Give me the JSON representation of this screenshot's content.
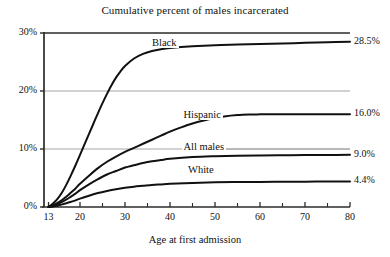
{
  "chart_data": {
    "type": "line",
    "title": "Cumulative percent of males incarcerated",
    "xlabel": "Age at first admission",
    "ylabel": "",
    "xlim": [
      13,
      80
    ],
    "ylim": [
      0,
      30
    ],
    "grid": true,
    "legend_position": "inline-labels",
    "x_ticks": [
      13,
      20,
      30,
      40,
      50,
      60,
      70,
      80
    ],
    "x_tick_labels": [
      "13",
      "20",
      "30",
      "40",
      "50",
      "60",
      "70",
      "80"
    ],
    "x_minor_ticks": [
      15,
      25,
      35,
      45,
      55,
      65,
      75
    ],
    "y_ticks": [
      0,
      10,
      20,
      30
    ],
    "y_tick_labels": [
      "0%",
      "10%",
      "20%",
      "30%"
    ],
    "series": [
      {
        "name": "Black",
        "label": "Black",
        "end_value_label": "28.5%",
        "end_value": 28.5,
        "x": [
          13,
          14,
          15,
          16,
          17,
          18,
          19,
          20,
          21,
          22,
          23,
          24,
          25,
          26,
          27,
          28,
          29,
          30,
          32,
          34,
          36,
          38,
          40,
          45,
          50,
          55,
          60,
          65,
          70,
          75,
          80
        ],
        "values": [
          0,
          0.6,
          1.4,
          2.5,
          3.9,
          5.5,
          7.2,
          9.0,
          10.8,
          12.6,
          14.4,
          16.2,
          17.9,
          19.5,
          21.0,
          22.3,
          23.4,
          24.3,
          25.6,
          26.4,
          26.9,
          27.2,
          27.4,
          27.7,
          27.9,
          28.0,
          28.1,
          28.2,
          28.3,
          28.4,
          28.5
        ]
      },
      {
        "name": "Hispanic",
        "label": "Hispanic",
        "end_value_label": "16.0%",
        "end_value": 16.0,
        "x": [
          13,
          14,
          15,
          16,
          17,
          18,
          19,
          20,
          22,
          24,
          26,
          28,
          30,
          32,
          34,
          36,
          38,
          40,
          42,
          45,
          48,
          50,
          52,
          55,
          58,
          60,
          65,
          70,
          75,
          80
        ],
        "values": [
          0,
          0.3,
          0.7,
          1.2,
          1.8,
          2.5,
          3.2,
          4.0,
          5.4,
          6.7,
          7.8,
          8.7,
          9.5,
          10.2,
          10.9,
          11.6,
          12.3,
          13.0,
          13.6,
          14.4,
          15.0,
          15.3,
          15.6,
          15.85,
          15.95,
          15.97,
          15.98,
          15.99,
          16.0,
          16.0
        ]
      },
      {
        "name": "All males",
        "label": "All males",
        "end_value_label": "9.0%",
        "end_value": 9.0,
        "x": [
          13,
          14,
          15,
          16,
          17,
          18,
          19,
          20,
          22,
          24,
          26,
          28,
          30,
          32,
          34,
          36,
          38,
          40,
          45,
          50,
          55,
          60,
          65,
          70,
          75,
          80
        ],
        "values": [
          0,
          0.2,
          0.5,
          0.9,
          1.3,
          1.8,
          2.3,
          2.9,
          3.9,
          4.8,
          5.6,
          6.2,
          6.8,
          7.2,
          7.6,
          7.9,
          8.1,
          8.3,
          8.6,
          8.75,
          8.85,
          8.9,
          8.93,
          8.96,
          8.98,
          9.0
        ]
      },
      {
        "name": "White",
        "label": "White",
        "end_value_label": "4.4%",
        "end_value": 4.4,
        "x": [
          13,
          14,
          15,
          16,
          17,
          18,
          19,
          20,
          22,
          24,
          26,
          28,
          30,
          32,
          34,
          36,
          38,
          40,
          45,
          50,
          55,
          60,
          65,
          70,
          75,
          80
        ],
        "values": [
          0,
          0.1,
          0.25,
          0.45,
          0.65,
          0.9,
          1.15,
          1.45,
          1.95,
          2.4,
          2.75,
          3.05,
          3.3,
          3.5,
          3.65,
          3.8,
          3.9,
          4.0,
          4.15,
          4.25,
          4.3,
          4.33,
          4.35,
          4.37,
          4.39,
          4.4
        ]
      }
    ],
    "series_label_positions": [
      {
        "name": "Black",
        "x": 36,
        "y": 28.0
      },
      {
        "name": "Hispanic",
        "x": 43,
        "y": 15.6
      },
      {
        "name": "All males",
        "x": 43,
        "y": 10.0
      },
      {
        "name": "White",
        "x": 44,
        "y": 6.1
      }
    ],
    "colors": {
      "line": "#111111",
      "grid": "#9a9a9a",
      "axis": "#2b2b2b",
      "background": "#ffffff",
      "text": "#111111"
    }
  }
}
